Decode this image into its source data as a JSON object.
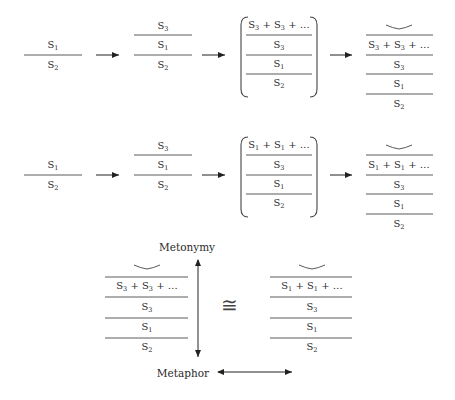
{
  "diagram": {
    "rows": [
      {
        "id": "row-1",
        "stage1": [
          {
            "base": "S",
            "sub": "1"
          },
          {
            "base": "S",
            "sub": "2"
          }
        ],
        "stage2": [
          {
            "base": "S",
            "sub": "3"
          },
          {
            "base": "S",
            "sub": "1"
          },
          {
            "base": "S",
            "sub": "2"
          }
        ],
        "stage3_bracketed": [
          {
            "text": "S",
            "sub": "3",
            "repeat": " + S",
            "sub2": "3",
            "tail": " + …"
          },
          {
            "base": "S",
            "sub": "3"
          },
          {
            "base": "S",
            "sub": "1"
          },
          {
            "base": "S",
            "sub": "2"
          }
        ],
        "stage4": [
          {
            "text": "S",
            "sub": "3",
            "repeat": " + S",
            "sub2": "3",
            "tail": " + …"
          },
          {
            "base": "S",
            "sub": "3"
          },
          {
            "base": "S",
            "sub": "1"
          },
          {
            "base": "S",
            "sub": "2"
          }
        ]
      },
      {
        "id": "row-2",
        "stage1": [
          {
            "base": "S",
            "sub": "1"
          },
          {
            "base": "S",
            "sub": "2"
          }
        ],
        "stage2": [
          {
            "base": "S",
            "sub": "3"
          },
          {
            "base": "S",
            "sub": "1"
          },
          {
            "base": "S",
            "sub": "2"
          }
        ],
        "stage3_bracketed": [
          {
            "text": "S",
            "sub": "1",
            "repeat": " + S",
            "sub2": "1",
            "tail": " + …"
          },
          {
            "base": "S",
            "sub": "3"
          },
          {
            "base": "S",
            "sub": "1"
          },
          {
            "base": "S",
            "sub": "2"
          }
        ],
        "stage4": [
          {
            "text": "S",
            "sub": "1",
            "repeat": " + S",
            "sub2": "1",
            "tail": " + …"
          },
          {
            "base": "S",
            "sub": "3"
          },
          {
            "base": "S",
            "sub": "1"
          },
          {
            "base": "S",
            "sub": "2"
          }
        ]
      }
    ],
    "comparison": {
      "left_stack": [
        {
          "text": "S",
          "sub": "3",
          "repeat": " + S",
          "sub2": "3",
          "tail": " + …"
        },
        {
          "base": "S",
          "sub": "3"
        },
        {
          "base": "S",
          "sub": "1"
        },
        {
          "base": "S",
          "sub": "2"
        }
      ],
      "right_stack": [
        {
          "text": "S",
          "sub": "1",
          "repeat": " + S",
          "sub2": "1",
          "tail": " + …"
        },
        {
          "base": "S",
          "sub": "3"
        },
        {
          "base": "S",
          "sub": "1"
        },
        {
          "base": "S",
          "sub": "2"
        }
      ],
      "vertical_axis_label_top": "Metonymy",
      "horizontal_axis_label": "Metaphor",
      "relation_symbol": "≅"
    }
  },
  "colors": {
    "line": "#555555",
    "text": "#2a2a2a",
    "arrow": "#222222"
  }
}
